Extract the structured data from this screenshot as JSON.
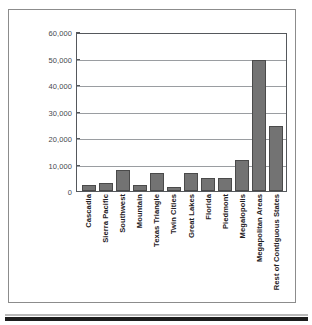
{
  "figure": {
    "background_color": "#ffffff",
    "frame_color": "#8c8c8c",
    "bar_fill_color": "#737373",
    "bar_border_color": "#4a4a4a",
    "gridline_color": "#9a9da1",
    "axis_color": "#55585c",
    "tick_label_color": "#46494d",
    "category_label_color": "#1f2124"
  },
  "chart_data": {
    "type": "bar",
    "title": "",
    "subtitle": "",
    "xlabel": "",
    "ylabel": "",
    "ylim": [
      0,
      60000
    ],
    "ytick_labels": [
      "0",
      "10,000",
      "20,000",
      "30,000",
      "40,000",
      "50,000",
      "60,000"
    ],
    "ytick_values": [
      0,
      10000,
      20000,
      30000,
      40000,
      50000,
      60000
    ],
    "grid": true,
    "grid_axis": "y",
    "legend": false,
    "legend_position": "none",
    "categories": [
      "Cascadia",
      "Sierra Pacific",
      "Southwest",
      "Mountain",
      "Texas Triangle",
      "Twin Cities",
      "Great Lakes",
      "Florida",
      "Piedmont",
      "Megalopolis",
      "Megapolitan Areas",
      "Rest of Contiguous States"
    ],
    "values": [
      2300,
      3000,
      8000,
      2300,
      6800,
      1500,
      6800,
      5000,
      5000,
      12000,
      50000,
      25000
    ]
  }
}
